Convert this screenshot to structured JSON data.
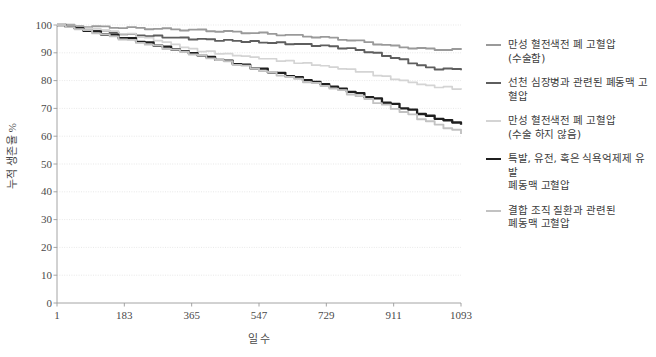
{
  "chart_data": {
    "type": "line",
    "title": "",
    "subtitle": "",
    "xlabel": "일 수",
    "ylabel": "누적 생존율 %",
    "xlim": [
      1,
      1093
    ],
    "ylim": [
      0,
      100
    ],
    "x_ticks": [
      "1",
      "183",
      "365",
      "547",
      "729",
      "911",
      "1093"
    ],
    "x_tick_values": [
      1,
      183,
      365,
      547,
      729,
      911,
      1093
    ],
    "y_ticks": [
      "0",
      "10",
      "20",
      "30",
      "40",
      "50",
      "60",
      "70",
      "80",
      "90",
      "100"
    ],
    "y_tick_values": [
      0,
      10,
      20,
      30,
      40,
      50,
      60,
      70,
      80,
      90,
      100
    ],
    "grid": true,
    "grid_axis": "y",
    "legend_position": "right",
    "x": [
      1,
      91,
      183,
      274,
      365,
      456,
      547,
      638,
      729,
      820,
      911,
      1002,
      1093
    ],
    "series": [
      {
        "name": "만성 혈전색전 폐 고혈압\n(수술함)",
        "color": "#9a9a9a",
        "width": 1.9,
        "values": [
          100,
          99.4,
          99.0,
          98.6,
          98.2,
          97.6,
          97.0,
          96.2,
          95.4,
          94.0,
          92.2,
          91.3,
          91.0
        ]
      },
      {
        "name": "선천 심장병과 관련된 폐동맥 고혈압",
        "color": "#5e5e5e",
        "width": 1.9,
        "values": [
          100,
          98.2,
          96.6,
          95.8,
          95.0,
          94.4,
          93.8,
          93.2,
          92.4,
          90.8,
          88.0,
          84.4,
          84.0
        ]
      },
      {
        "name": "만성 혈전색전 폐 고혈압\n(수술 하지 않음)",
        "color": "#d4d4d4",
        "width": 1.7,
        "values": [
          100,
          98.6,
          96.8,
          94.2,
          91.0,
          89.4,
          88.0,
          86.6,
          85.0,
          83.2,
          80.4,
          78.0,
          77.0
        ]
      },
      {
        "name": "특발, 유전, 혹은 식욕억제제 유발\n폐동맥 고혈압",
        "color": "#1f1f1f",
        "width": 2.3,
        "values": [
          100,
          97.6,
          95.2,
          92.4,
          89.6,
          86.8,
          84.0,
          81.2,
          78.2,
          74.8,
          71.0,
          67.0,
          64.2
        ]
      },
      {
        "name": "결합 조직 질환과 관련된\n폐동맥 고혈압",
        "color": "#c2c2c2",
        "width": 1.9,
        "values": [
          100,
          97.4,
          94.6,
          92.0,
          89.4,
          86.6,
          83.6,
          80.6,
          77.6,
          73.8,
          69.6,
          65.0,
          61.0
        ]
      }
    ]
  },
  "legend": {
    "items": [
      {
        "label": "만성 혈전색전 폐 고혈압\n(수술함)",
        "color": "#9a9a9a",
        "width": 2
      },
      {
        "label": "선천 심장병과 관련된 폐동맥 고혈압",
        "color": "#5e5e5e",
        "width": 2
      },
      {
        "label": "만성 혈전색전 폐 고혈압\n(수술 하지 않음)",
        "color": "#d4d4d4",
        "width": 2
      },
      {
        "label": "특발, 유전, 혹은 식욕억제제 유발\n폐동맥 고혈압",
        "color": "#1f1f1f",
        "width": 2.4
      },
      {
        "label": "결합 조직 질환과 관련된\n폐동맥 고혈압",
        "color": "#c2c2c2",
        "width": 2
      }
    ]
  },
  "style": {
    "background": "#ffffff",
    "axis_color": "#9a9a9a",
    "grid_color": "#dedede",
    "text_color": "#4a4a4a"
  }
}
